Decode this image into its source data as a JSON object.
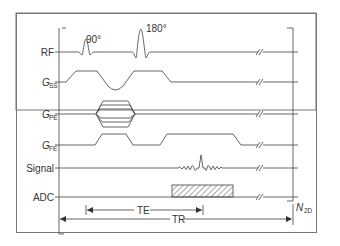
{
  "diagram": {
    "rows": [
      {
        "id": "rf",
        "label_main": "RF",
        "label_sub": ""
      },
      {
        "id": "gss",
        "label_main": "G",
        "label_sub": "SS"
      },
      {
        "id": "gpe",
        "label_main": "G",
        "label_sub": "PE"
      },
      {
        "id": "gfe",
        "label_main": "G",
        "label_sub": "FE"
      },
      {
        "id": "signal",
        "label_main": "Signal",
        "label_sub": ""
      },
      {
        "id": "adc",
        "label_main": "ADC",
        "label_sub": ""
      }
    ],
    "pulses": {
      "excitation": "90°",
      "refocusing": "180°"
    },
    "timings": {
      "te_label": "TE",
      "tr_label": "TR"
    },
    "repeat": {
      "label_main": "N",
      "label_sub": "2D"
    },
    "colors": {
      "line": "#555555",
      "frame": "#777777",
      "text": "#333333"
    }
  }
}
